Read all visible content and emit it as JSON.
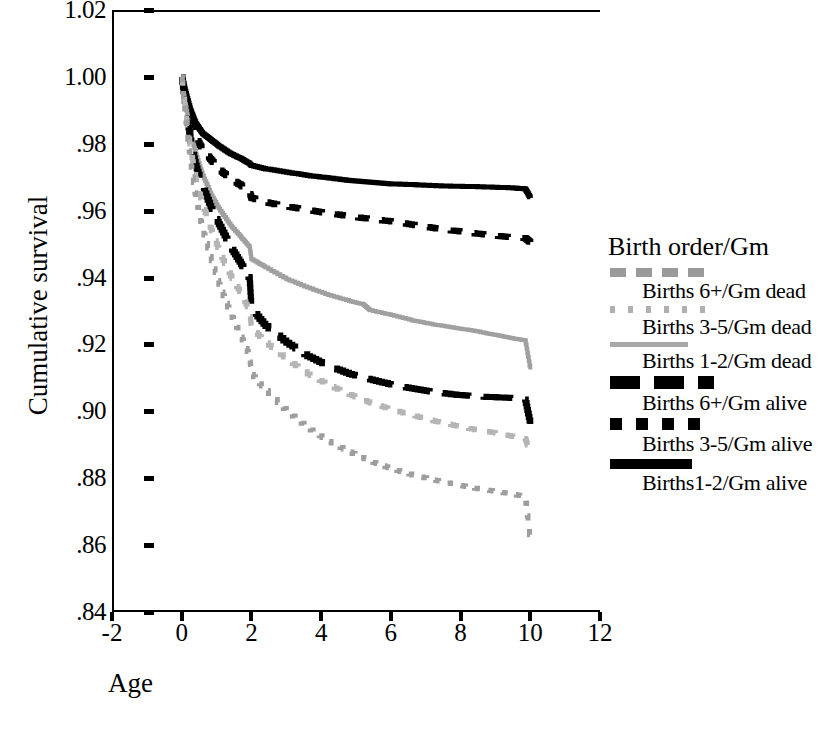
{
  "chart_data": {
    "type": "line",
    "title": "",
    "xlabel": "Age",
    "ylabel": "Cumulative survival",
    "xlim": [
      -2,
      12
    ],
    "ylim": [
      0.84,
      1.02
    ],
    "xticks": [
      "-2",
      "0",
      "2",
      "4",
      "6",
      "8",
      "10",
      "12"
    ],
    "xtick_values": [
      -2,
      0,
      2,
      4,
      6,
      8,
      10,
      12
    ],
    "yticks": [
      "1.02",
      "1.00",
      ".98",
      ".96",
      ".94",
      ".92",
      ".90",
      ".88",
      ".86",
      ".84"
    ],
    "ytick_values": [
      1.02,
      1.0,
      0.98,
      0.96,
      0.94,
      0.92,
      0.9,
      0.88,
      0.86,
      0.84
    ],
    "grid": false,
    "legend_position": "right",
    "legend_title": "Birth order/Gm",
    "series": [
      {
        "name": "Births 1-2/Gm alive",
        "style": "solid",
        "color": "#000000",
        "width": 5,
        "x": [
          0,
          0.12,
          0.25,
          0.4,
          0.6,
          0.85,
          1.1,
          1.4,
          1.7,
          1.95,
          2.0,
          2.4,
          3.0,
          3.6,
          4.2,
          4.8,
          5.4,
          6.0,
          6.6,
          7.2,
          7.8,
          8.4,
          9.0,
          9.5,
          9.85,
          10.0
        ],
        "y": [
          1.0,
          0.995,
          0.99,
          0.986,
          0.983,
          0.981,
          0.979,
          0.977,
          0.9755,
          0.974,
          0.9735,
          0.9725,
          0.9715,
          0.9705,
          0.9698,
          0.969,
          0.9685,
          0.968,
          0.9678,
          0.9675,
          0.9673,
          0.9672,
          0.967,
          0.9668,
          0.9665,
          0.9638
        ]
      },
      {
        "name": "Births 3-5/Gm alive",
        "style": "dotted",
        "color": "#000000",
        "width": 6,
        "x": [
          0,
          0.12,
          0.25,
          0.4,
          0.6,
          0.85,
          1.1,
          1.4,
          1.7,
          1.95,
          2.0,
          2.4,
          3.0,
          3.6,
          4.2,
          4.8,
          5.4,
          6.0,
          6.6,
          7.2,
          7.8,
          8.4,
          9.0,
          9.5,
          9.85,
          10.0
        ],
        "y": [
          1.0,
          0.993,
          0.987,
          0.982,
          0.978,
          0.975,
          0.972,
          0.9695,
          0.9675,
          0.9655,
          0.9638,
          0.9625,
          0.9612,
          0.9602,
          0.9592,
          0.9583,
          0.9575,
          0.9568,
          0.9558,
          0.9548,
          0.954,
          0.9532,
          0.9525,
          0.952,
          0.9518,
          0.9505
        ]
      },
      {
        "name": "Births 1-2/Gm dead",
        "style": "solid",
        "color": "#a0a0a0",
        "width": 4,
        "x": [
          0,
          0.12,
          0.25,
          0.4,
          0.6,
          0.85,
          1.1,
          1.4,
          1.7,
          1.95,
          2.0,
          2.4,
          3.0,
          3.6,
          4.2,
          4.8,
          5.2,
          5.4,
          6.0,
          6.6,
          7.2,
          7.8,
          8.4,
          9.0,
          9.5,
          9.85,
          10.0
        ],
        "y": [
          1.0,
          0.991,
          0.983,
          0.977,
          0.9705,
          0.9645,
          0.96,
          0.9555,
          0.952,
          0.949,
          0.9455,
          0.943,
          0.9395,
          0.937,
          0.9348,
          0.933,
          0.932,
          0.9302,
          0.9288,
          0.9272,
          0.926,
          0.925,
          0.924,
          0.9228,
          0.9218,
          0.9212,
          0.9125
        ]
      },
      {
        "name": "Births 6+/Gm alive",
        "style": "dashed",
        "color": "#000000",
        "width": 6,
        "x": [
          0,
          0.12,
          0.25,
          0.4,
          0.6,
          0.85,
          1.1,
          1.4,
          1.7,
          1.95,
          2.0,
          2.4,
          3.0,
          3.6,
          4.2,
          4.8,
          5.4,
          6.0,
          6.6,
          7.2,
          7.8,
          8.4,
          9.0,
          9.5,
          9.85,
          10.0
        ],
        "y": [
          1.0,
          0.99,
          0.981,
          0.9735,
          0.967,
          0.9605,
          0.9552,
          0.949,
          0.944,
          0.9395,
          0.9305,
          0.9255,
          0.9205,
          0.9165,
          0.9135,
          0.9112,
          0.9095,
          0.908,
          0.9068,
          0.9058,
          0.905,
          0.9045,
          0.9042,
          0.904,
          0.9035,
          0.8962
        ]
      },
      {
        "name": "Births 3-5/Gm dead",
        "style": "dotted",
        "color": "#b5b5b5",
        "width": 5,
        "x": [
          0,
          0.12,
          0.25,
          0.4,
          0.6,
          0.85,
          1.1,
          1.4,
          1.7,
          1.95,
          2.0,
          2.4,
          3.0,
          3.6,
          4.2,
          4.8,
          5.4,
          6.0,
          6.6,
          7.2,
          7.8,
          8.4,
          9.0,
          9.5,
          9.85,
          10.0
        ],
        "y": [
          1.0,
          0.9885,
          0.9785,
          0.9695,
          0.9615,
          0.954,
          0.947,
          0.9405,
          0.935,
          0.9298,
          0.9248,
          0.9205,
          0.9155,
          0.9112,
          0.9078,
          0.905,
          0.9025,
          0.9005,
          0.8988,
          0.8972,
          0.8958,
          0.8945,
          0.8935,
          0.8925,
          0.8918,
          0.8875
        ]
      },
      {
        "name": "Births 6+/Gm dead",
        "style": "dotted-sparse",
        "color": "#9e9e9e",
        "width": 5,
        "x": [
          0,
          0.12,
          0.25,
          0.4,
          0.6,
          0.85,
          1.1,
          1.4,
          1.7,
          1.95,
          2.0,
          2.4,
          3.0,
          3.6,
          4.2,
          4.8,
          5.4,
          6.0,
          6.6,
          7.2,
          7.8,
          8.4,
          9.0,
          9.5,
          9.85,
          10.0
        ],
        "y": [
          1.0,
          0.9865,
          0.9745,
          0.9638,
          0.954,
          0.945,
          0.9368,
          0.929,
          0.9222,
          0.9162,
          0.911,
          0.9062,
          0.9,
          0.895,
          0.891,
          0.8878,
          0.885,
          0.8828,
          0.881,
          0.8795,
          0.8782,
          0.877,
          0.876,
          0.8752,
          0.8745,
          0.8612
        ]
      }
    ]
  },
  "axes": {
    "y_title": "Cumulative survival",
    "x_title": "Age",
    "y_labels": [
      "1.02",
      "1.00",
      ".98",
      ".96",
      ".94",
      ".92",
      ".90",
      ".88",
      ".86",
      ".84"
    ],
    "x_labels": [
      "-2",
      "0",
      "2",
      "4",
      "6",
      "8",
      "10",
      "12"
    ]
  },
  "legend": {
    "title": "Birth order/Gm",
    "entries": [
      {
        "label": "Births 6+/Gm dead",
        "swatch": "dot-sparse-gray"
      },
      {
        "label": "Births 3-5/Gm dead",
        "swatch": "dot-tiny-gray"
      },
      {
        "label": "Births 1-2/Gm dead",
        "swatch": "solid-gray"
      },
      {
        "label": "Births 6+/Gm alive",
        "swatch": "dash-black"
      },
      {
        "label": "Births 3-5/Gm alive",
        "swatch": "dot-black"
      },
      {
        "label": "Births1-2/Gm alive",
        "swatch": "solid-black"
      }
    ]
  },
  "colors": {
    "axis": "#000000",
    "black_series": "#000000",
    "gray_series": "#a0a0a0",
    "light_gray_series": "#b5b5b5",
    "background": "#ffffff"
  }
}
